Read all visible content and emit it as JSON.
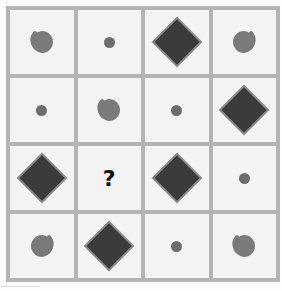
{
  "puzzle": {
    "rows": 4,
    "cols": 4,
    "cells": [
      [
        "spiral",
        "dot",
        "diamond",
        "spiral-reverse"
      ],
      [
        "dot",
        "spiral",
        "dot",
        "diamond"
      ],
      [
        "diamond",
        "?",
        "diamond",
        "dot"
      ],
      [
        "spiral-reverse",
        "diamond",
        "dot",
        "spiral"
      ]
    ],
    "question_mark": "?"
  },
  "colors": {
    "grid_line": "#b4b4b4",
    "cell_bg": "#f3f3f3",
    "spiral": "#7a7a7a",
    "dot": "#6d6d6d",
    "diamond": "#3b3b3b"
  }
}
